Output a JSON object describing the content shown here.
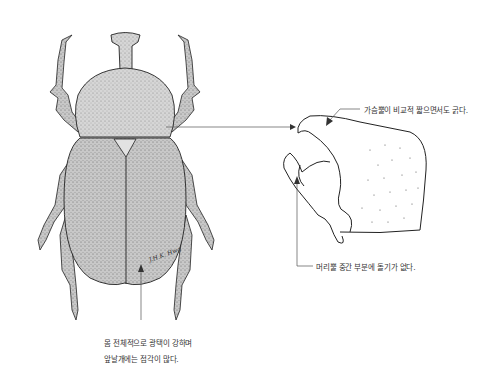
{
  "figure": {
    "colors": {
      "outline": "#222222",
      "fill": "#cfcfcf",
      "leader": "#555555",
      "text": "#333333"
    },
    "signature": "signature"
  },
  "annotations": {
    "pronotum": "가슴뿔이 비교적 짧으면서도 굵다.",
    "head": "머리뿔 중간 부분에 돌기가 없다.",
    "body_line1": "몸 전체적으로 광택이 강하며",
    "body_line2": "앞날개에는 점각이 많다."
  }
}
